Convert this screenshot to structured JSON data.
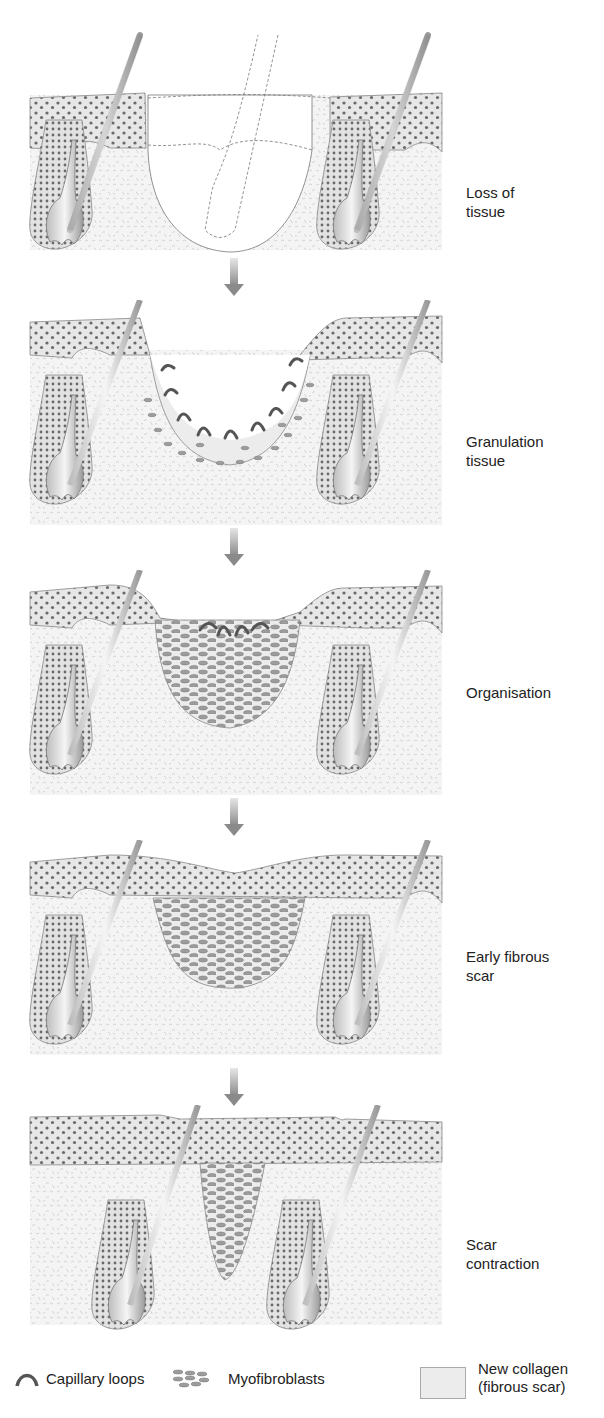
{
  "diagram": {
    "type": "sequence",
    "stages": [
      {
        "label_lines": [
          "Loss of",
          "tissue"
        ]
      },
      {
        "label_lines": [
          "Granulation",
          "tissue"
        ]
      },
      {
        "label_lines": [
          "Organisation"
        ]
      },
      {
        "label_lines": [
          "Early fibrous",
          "scar"
        ]
      },
      {
        "label_lines": [
          "Scar",
          "contraction"
        ]
      }
    ],
    "legend": {
      "capillary": "Capillary loops",
      "myofibroblasts": "Myofibroblasts",
      "collagen_line1": "New collagen",
      "collagen_line2": "(fibrous scar)"
    },
    "colors": {
      "epidermis_fill": "#e9e9e9",
      "dermis_fill": "#f1f1f1",
      "dot": "#6a6a6a",
      "myofibroblast": "#9a9a9a",
      "capillary": "#555555",
      "collagen": "#ececec",
      "arrow": "#8c8c8c"
    }
  }
}
